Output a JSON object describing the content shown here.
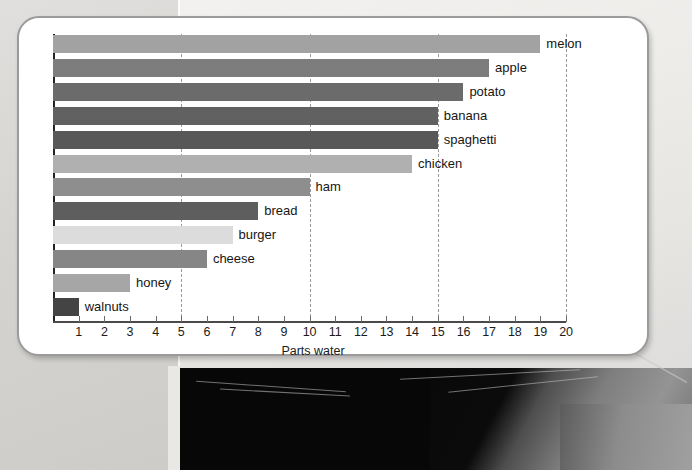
{
  "background": {
    "description": "photograph-of-printed-page",
    "dark_region_color": "#070707",
    "paper_color": "#e8e7e4"
  },
  "card": {
    "border_color": "#9b9b9b",
    "background_color": "#ffffff"
  },
  "chart_data": {
    "type": "bar",
    "orientation": "horizontal",
    "title": "",
    "subtitle": "",
    "xlabel": "Parts water",
    "ylabel": "",
    "xlim": [
      0,
      20
    ],
    "ylim": null,
    "grid": "vertical-dashed-at-5-10-15-20",
    "legend": "none",
    "bar_label_position": "outside-right",
    "categories": [
      "melon",
      "apple",
      "potato",
      "banana",
      "spaghetti",
      "chicken",
      "ham",
      "bread",
      "burger",
      "cheese",
      "honey",
      "walnuts"
    ],
    "values": [
      19,
      17,
      16,
      15,
      15,
      14,
      10,
      8,
      7,
      6,
      3,
      1
    ],
    "bar_colors": [
      "#a2a2a2",
      "#7d7d7d",
      "#6b6b6b",
      "#616161",
      "#585858",
      "#b0b0b0",
      "#8e8e8e",
      "#5e5e5e",
      "#dcdcdc",
      "#868686",
      "#a6a6a6",
      "#444444"
    ],
    "xticks": [
      1,
      2,
      3,
      4,
      5,
      6,
      7,
      8,
      9,
      10,
      11,
      12,
      13,
      14,
      15,
      16,
      17,
      18,
      19,
      20
    ],
    "xtick_labels": [
      "1",
      "2",
      "3",
      "4",
      "5",
      "6",
      "7",
      "8",
      "9",
      "10",
      "11",
      "12",
      "13",
      "14",
      "15",
      "16",
      "17",
      "18",
      "19",
      "20"
    ],
    "gridline_values": [
      5,
      10,
      15,
      20
    ],
    "axis_color": "#222222",
    "gridline_color": "#9a9a9a"
  }
}
